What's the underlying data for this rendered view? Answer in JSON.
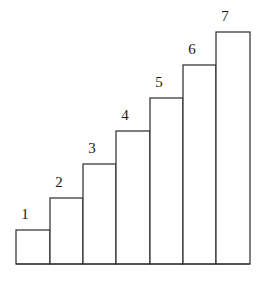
{
  "diagram": {
    "type": "staircase-bars",
    "stroke_color": "#2a2a2a",
    "fill_color": "#ffffff",
    "baseline_y": 264,
    "bars": [
      {
        "label": "1",
        "x": 16,
        "width": 34,
        "top": 230
      },
      {
        "label": "2",
        "x": 50,
        "width": 33,
        "top": 198
      },
      {
        "label": "3",
        "x": 83,
        "width": 33,
        "top": 164
      },
      {
        "label": "4",
        "x": 116,
        "width": 34,
        "top": 131
      },
      {
        "label": "5",
        "x": 150,
        "width": 33,
        "top": 98
      },
      {
        "label": "6",
        "x": 183,
        "width": 33,
        "top": 65
      },
      {
        "label": "7",
        "x": 216,
        "width": 34,
        "top": 32
      }
    ]
  }
}
